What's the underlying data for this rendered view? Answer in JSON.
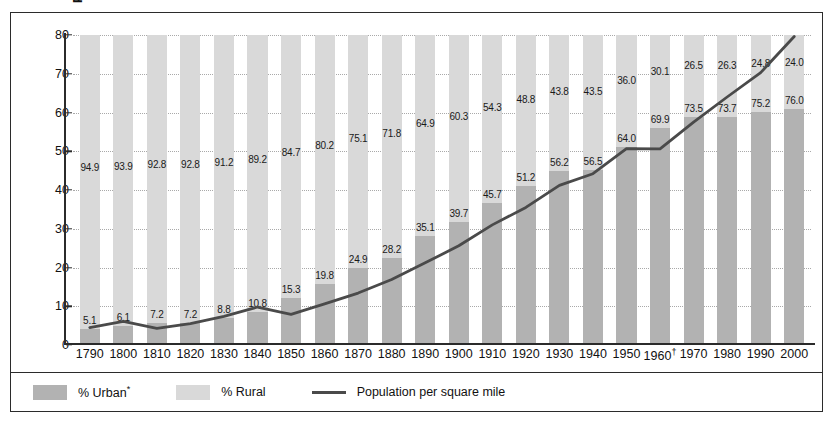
{
  "chart_data": {
    "type": "bar",
    "title": "",
    "subtitle": "",
    "xlabel": "",
    "ylabel": "Population per square mile",
    "ylim": [
      0,
      80
    ],
    "yticks": [
      0,
      10,
      20,
      30,
      40,
      50,
      60,
      70,
      80
    ],
    "grid": true,
    "legend_position": "bottom",
    "stacked": true,
    "categories": [
      "1790",
      "1800",
      "1810",
      "1820",
      "1830",
      "1840",
      "1850",
      "1860",
      "1870",
      "1880",
      "1890",
      "1900",
      "1910",
      "1920",
      "1930",
      "1940",
      "1950",
      "1960†",
      "1970",
      "1980",
      "1990",
      "2000"
    ],
    "series": [
      {
        "name": "% Urban*",
        "type": "bar",
        "color": "#b2b2b2",
        "values": [
          5.1,
          6.1,
          7.2,
          7.2,
          8.8,
          10.8,
          15.3,
          19.8,
          24.9,
          28.2,
          35.1,
          39.7,
          45.7,
          51.2,
          56.2,
          56.5,
          64.0,
          69.9,
          73.5,
          73.7,
          75.2,
          76.0
        ]
      },
      {
        "name": "% Rural",
        "type": "bar",
        "color": "#d9d9d9",
        "values": [
          94.9,
          93.9,
          92.8,
          92.8,
          91.2,
          89.2,
          84.7,
          80.2,
          75.1,
          71.8,
          64.9,
          60.3,
          54.3,
          48.8,
          43.8,
          43.5,
          36.0,
          30.1,
          26.5,
          26.3,
          24.8,
          24.0
        ]
      },
      {
        "name": "Population per square mile",
        "type": "line",
        "color": "#4a4a4a",
        "values": [
          4.5,
          6.1,
          4.3,
          5.5,
          7.4,
          9.8,
          7.9,
          10.6,
          13.4,
          16.9,
          21.2,
          25.6,
          31.0,
          35.5,
          41.2,
          44.2,
          50.7,
          50.6,
          57.5,
          64.0,
          70.3,
          79.6
        ]
      }
    ]
  },
  "axis": {
    "ylabel": "Population per square mile"
  },
  "legend": {
    "urban_label": "% Urban",
    "urban_marker": "*",
    "rural_label": "% Rural",
    "line_label": "Population per square mile"
  }
}
